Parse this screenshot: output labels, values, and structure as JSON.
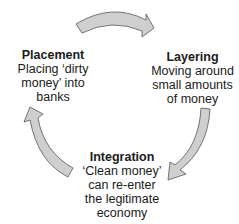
{
  "diagram": {
    "stages": [
      {
        "title": "Placement",
        "lines": [
          "Placing ‘dirty",
          "money’ into",
          "banks"
        ]
      },
      {
        "title": "Layering",
        "lines": [
          "Moving around",
          "small amounts",
          "of money"
        ]
      },
      {
        "title": "Integration",
        "lines": [
          "‘Clean money’",
          "can re-enter",
          "the legitimate",
          "economy"
        ]
      }
    ],
    "arrow_fill": "#cfcfcf",
    "arrow_stroke": "#555555"
  }
}
